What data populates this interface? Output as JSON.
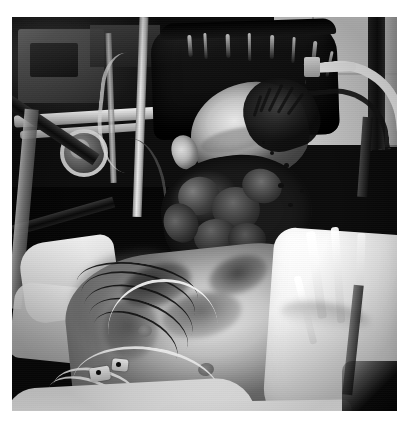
{
  "page": {
    "background_color": "#ffffff",
    "width": 410,
    "height": 427,
    "caption": ""
  },
  "photograph": {
    "name": "clinical-photograph",
    "description": "Black and white clinical photograph of a patient lying in a hospital bed",
    "orientation": "landscape-subject",
    "color_mode": "grayscale",
    "frame": {
      "left": 12,
      "top": 17,
      "width": 385,
      "height": 394
    },
    "tones": {
      "darkest": "#0a0a0c",
      "shadow": "#1b1b1f",
      "midtone": "#8e8a82",
      "highlight": "#e8e7e3",
      "lightest": "#ffffff",
      "wall_gray": "#cdcdcd"
    },
    "regions": [
      {
        "id": "background-equipment",
        "label": "Medical equipment and monitors in shadow",
        "position": "upper-left"
      },
      {
        "id": "wall",
        "label": "Light gray wall panel",
        "position": "upper-right"
      },
      {
        "id": "bed-rail",
        "label": "White curved bed rail",
        "position": "upper-right"
      },
      {
        "id": "headrest",
        "label": "Dark vinyl headrest with highlight streaks",
        "position": "top-center"
      },
      {
        "id": "head",
        "label": "Patient head with matted hair and extensive facial injury",
        "position": "center"
      },
      {
        "id": "torso",
        "label": "Bare chest with ECG lead wires and electrode pads",
        "position": "center-left-lower"
      },
      {
        "id": "linens",
        "label": "White hospital sheets and drapes",
        "position": "right-lower"
      }
    ]
  }
}
